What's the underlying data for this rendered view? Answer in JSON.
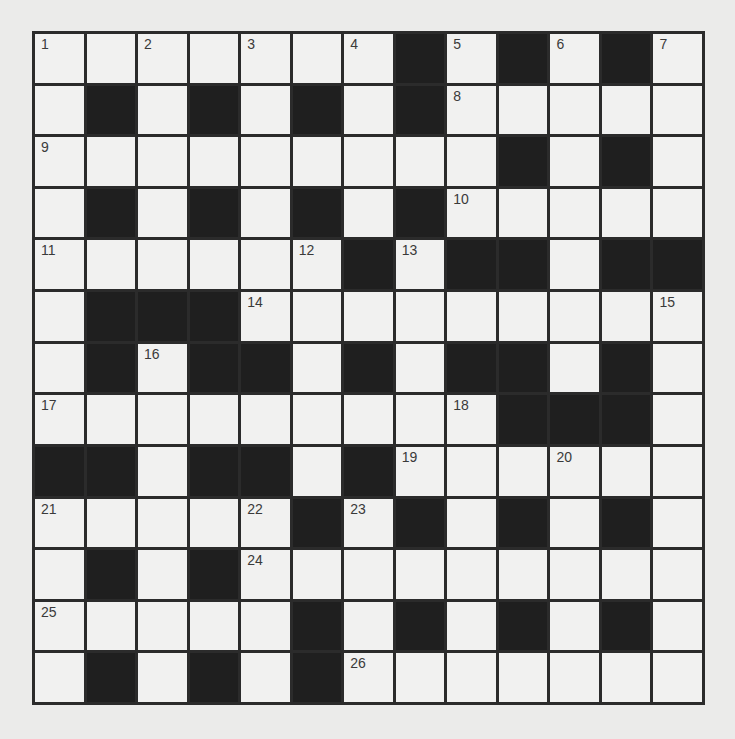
{
  "puzzle": {
    "rows": 13,
    "cols": 13,
    "colors": {
      "page_background": "#ebebea",
      "cell_background": "#f1f1f0",
      "block_color": "#1f1f1f",
      "grid_line_color": "#2b2b2b",
      "number_color": "#3a3a3a"
    },
    "layout": [
      "1.2.3.4#5#6#7",
      ".#.#.#.#8....",
      "9........#.#.",
      ".#.#.#.#A....",
      "B....C#D##.##",
      ".###E.......F",
      ".#G##.#.##.#.",
      "H.......I###.",
      "##.##.#J..K..",
      "L...M#N#.#.#.",
      ".#.#O........",
      "P....#.#.#.#.",
      ".#.#.#Q......"
    ],
    "grid": [
      [
        1,
        0,
        2,
        0,
        3,
        0,
        4,
        -1,
        5,
        -1,
        6,
        -1,
        7
      ],
      [
        0,
        -1,
        0,
        -1,
        0,
        -1,
        0,
        -1,
        8,
        0,
        0,
        0,
        0
      ],
      [
        9,
        0,
        0,
        0,
        0,
        0,
        0,
        0,
        0,
        -1,
        0,
        -1,
        0
      ],
      [
        0,
        -1,
        0,
        -1,
        0,
        -1,
        0,
        -1,
        10,
        0,
        0,
        0,
        0
      ],
      [
        11,
        0,
        0,
        0,
        0,
        12,
        -1,
        13,
        -1,
        -1,
        0,
        -1,
        -1
      ],
      [
        0,
        -1,
        -1,
        -1,
        14,
        0,
        0,
        0,
        0,
        0,
        0,
        0,
        15
      ],
      [
        0,
        -1,
        16,
        -1,
        -1,
        0,
        -1,
        0,
        -1,
        -1,
        0,
        -1,
        0
      ],
      [
        17,
        0,
        0,
        0,
        0,
        0,
        0,
        0,
        18,
        -1,
        -1,
        -1,
        0
      ],
      [
        -1,
        -1,
        0,
        -1,
        -1,
        0,
        -1,
        19,
        0,
        0,
        20,
        0,
        0
      ],
      [
        21,
        0,
        0,
        0,
        22,
        -1,
        23,
        -1,
        0,
        -1,
        0,
        -1,
        0
      ],
      [
        0,
        -1,
        0,
        -1,
        24,
        0,
        0,
        0,
        0,
        0,
        0,
        0,
        0
      ],
      [
        25,
        0,
        0,
        0,
        0,
        -1,
        0,
        -1,
        0,
        -1,
        0,
        -1,
        0
      ],
      [
        0,
        -1,
        0,
        -1,
        0,
        -1,
        26,
        0,
        0,
        0,
        0,
        0,
        0
      ]
    ],
    "legend": {
      "-1": "black block",
      "0": "empty white cell",
      "n>0": "white cell with clue number n"
    },
    "entries": {
      "across": [
        1,
        8,
        9,
        10,
        11,
        14,
        17,
        19,
        21,
        24,
        25,
        26
      ],
      "down": [
        1,
        2,
        3,
        4,
        5,
        6,
        7,
        12,
        13,
        15,
        16,
        18,
        20,
        22,
        23
      ]
    }
  }
}
